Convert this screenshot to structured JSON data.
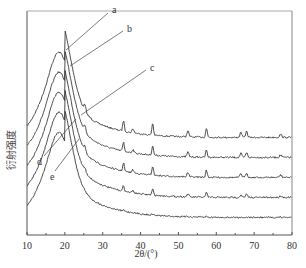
{
  "chart_data": {
    "type": "line",
    "title": "",
    "xlabel": "2θ/(°)",
    "ylabel": "衍射强度",
    "xlim": [
      10,
      80
    ],
    "xticks": [
      10,
      20,
      30,
      40,
      50,
      60,
      70,
      80
    ],
    "yticks": [],
    "grid": false,
    "legend": "none",
    "broad_peak_2theta": 18,
    "sharp_peaks_2theta": [
      25.3,
      35.5,
      38.0,
      43.2,
      52.5,
      57.4,
      66.5,
      68.0,
      77.0
    ],
    "series": [
      {
        "name": "a",
        "offset": 4,
        "broad_peak": 1.0,
        "sharp_peak_scale": 1.0
      },
      {
        "name": "b",
        "offset": 3,
        "broad_peak": 1.0,
        "sharp_peak_scale": 0.8
      },
      {
        "name": "c",
        "offset": 2,
        "broad_peak": 1.0,
        "sharp_peak_scale": 0.75
      },
      {
        "name": "d",
        "offset": 1,
        "broad_peak": 1.0,
        "sharp_peak_scale": 0.5
      },
      {
        "name": "e",
        "offset": 0,
        "broad_peak": 1.0,
        "sharp_peak_scale": 0.1
      }
    ],
    "annotations": [
      "a",
      "b",
      "c",
      "d",
      "e"
    ]
  }
}
